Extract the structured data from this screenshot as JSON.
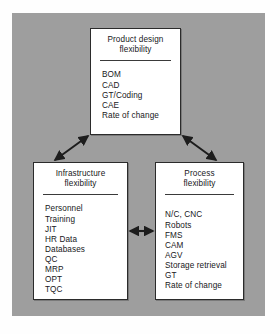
{
  "figure": {
    "background_color": "#9e9e9e",
    "page_color": "#fefefe",
    "node_fill": "#ffffff",
    "line_color": "#2b2b2b"
  },
  "nodes": {
    "product_design": {
      "title_line1": "Product design",
      "title_line2": "flexibility",
      "items": [
        "BOM",
        "CAD",
        "GT/Coding",
        "CAE",
        "Rate of change"
      ]
    },
    "infrastructure": {
      "title_line1": "Infrastructure",
      "title_line2": "flexibility",
      "items": [
        "Personnel",
        "Training",
        "JIT",
        "HR Data",
        "Databases",
        "QC",
        "MRP",
        "OPT",
        "TQC"
      ]
    },
    "process": {
      "title_line1": "Process",
      "title_line2": "flexibility",
      "items": [
        "N/C, CNC",
        "Robots",
        "FMS",
        "CAM",
        "AGV",
        "Storage retrieval",
        "GT",
        "Rate of change"
      ]
    }
  },
  "connectors": [
    {
      "name": "product-to-infrastructure",
      "style": "double-headed-arrow",
      "orientation": "diagonal"
    },
    {
      "name": "product-to-process",
      "style": "double-headed-arrow",
      "orientation": "diagonal"
    },
    {
      "name": "infrastructure-to-process",
      "style": "double-headed-arrow",
      "orientation": "horizontal"
    }
  ]
}
